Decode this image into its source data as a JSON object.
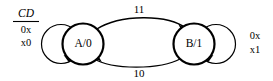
{
  "diagram": {
    "type": "state-transition-diagram",
    "input_header": "CD",
    "states": [
      {
        "id": "A",
        "label": "A/0",
        "cx": 83,
        "cy": 44,
        "r": 20.5
      },
      {
        "id": "B",
        "label": "B/1",
        "cx": 194,
        "cy": 44,
        "r": 20.5
      }
    ],
    "self_loops": [
      {
        "state": "A",
        "side": "left",
        "condition_lines": [
          "0x",
          "x0"
        ],
        "label_x": 26,
        "label_y_top": 31,
        "label_y_bottom": 44
      },
      {
        "state": "B",
        "side": "right",
        "condition_lines": [
          "0x",
          "x1"
        ],
        "label_x": 255,
        "label_y_top": 37,
        "label_y_bottom": 51
      }
    ],
    "transitions": [
      {
        "from": "A",
        "to": "B",
        "label": "11",
        "position": "top",
        "label_x": 139,
        "label_y": 10
      },
      {
        "from": "B",
        "to": "A",
        "label": "10",
        "position": "bottom",
        "label_x": 139,
        "label_y": 74
      }
    ],
    "colors": {
      "stroke": "#000000",
      "background": "#ffffff",
      "text": "#000000"
    }
  }
}
